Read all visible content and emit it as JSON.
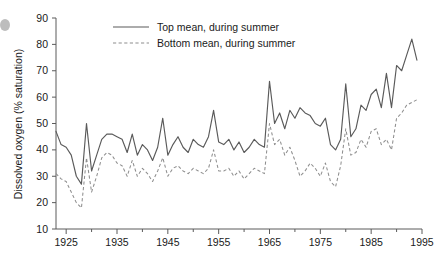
{
  "chart_data": {
    "type": "line",
    "title": "",
    "xlabel": "",
    "ylabel": "Dissolved oxygen (% saturation)",
    "xlim": [
      1923,
      1995
    ],
    "ylim": [
      10,
      90
    ],
    "xticks": [
      1925,
      1935,
      1945,
      1955,
      1965,
      1975,
      1985,
      1995
    ],
    "xticks_minor": [
      1930,
      1940,
      1950,
      1960,
      1970,
      1980,
      1990
    ],
    "yticks": [
      10,
      20,
      30,
      40,
      50,
      60,
      70,
      80,
      90
    ],
    "grid": false,
    "legend_position": "top-center",
    "x": [
      1923,
      1924,
      1925,
      1926,
      1927,
      1928,
      1929,
      1930,
      1931,
      1932,
      1933,
      1934,
      1935,
      1936,
      1937,
      1938,
      1939,
      1940,
      1941,
      1942,
      1943,
      1944,
      1945,
      1946,
      1947,
      1948,
      1949,
      1950,
      1951,
      1952,
      1953,
      1954,
      1955,
      1956,
      1957,
      1958,
      1959,
      1960,
      1961,
      1962,
      1963,
      1964,
      1965,
      1966,
      1967,
      1968,
      1969,
      1970,
      1971,
      1972,
      1973,
      1974,
      1975,
      1976,
      1977,
      1978,
      1979,
      1980,
      1981,
      1982,
      1983,
      1984,
      1985,
      1986,
      1987,
      1988,
      1989,
      1990,
      1991,
      1992,
      1993,
      1994
    ],
    "series": [
      {
        "name": "Top mean, during summer",
        "style": "solid",
        "color": "#5a5a5a",
        "values": [
          47,
          42,
          41,
          38,
          30,
          27,
          50,
          32,
          38,
          44,
          46,
          46,
          45,
          44,
          39,
          46,
          38,
          42,
          40,
          36,
          41,
          52,
          38,
          42,
          45,
          41,
          39,
          44,
          42,
          41,
          45,
          55,
          43,
          42,
          44,
          40,
          43,
          39,
          41,
          44,
          42,
          41,
          66,
          50,
          54,
          48,
          55,
          52,
          56,
          54,
          53,
          50,
          49,
          52,
          42,
          40,
          44,
          65,
          45,
          48,
          57,
          55,
          61,
          63,
          56,
          69,
          56,
          72,
          70,
          76,
          82,
          74
        ]
      },
      {
        "name": "Bottom mean, during summer",
        "style": "dashed",
        "color": "#8e8e8e",
        "values": [
          31,
          29,
          28,
          24,
          20,
          18,
          37,
          24,
          30,
          37,
          39,
          38,
          35,
          34,
          30,
          36,
          30,
          33,
          31,
          28,
          32,
          37,
          30,
          33,
          34,
          32,
          31,
          33,
          32,
          31,
          33,
          40,
          32,
          32,
          33,
          30,
          32,
          29,
          31,
          33,
          32,
          31,
          50,
          42,
          44,
          38,
          41,
          36,
          30,
          32,
          35,
          33,
          30,
          35,
          28,
          26,
          34,
          48,
          38,
          39,
          44,
          41,
          47,
          48,
          42,
          44,
          40,
          52,
          54,
          57,
          58,
          59
        ]
      }
    ],
    "legend": [
      {
        "label": "Top mean, during summer",
        "style": "solid",
        "color": "#5a5a5a"
      },
      {
        "label": "Bottom mean, during summer",
        "style": "dashed",
        "color": "#8e8e8e"
      }
    ],
    "axis_color": "#5b5b5b",
    "background": "#ffffff"
  }
}
